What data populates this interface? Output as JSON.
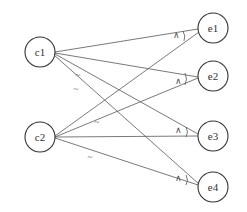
{
  "diagram": {
    "type": "bipartite-graph",
    "left_nodes": [
      {
        "id": "c1",
        "label": "c1",
        "cx": 40,
        "cy": 52
      },
      {
        "id": "c2",
        "label": "c2",
        "cx": 40,
        "cy": 137
      }
    ],
    "right_nodes": [
      {
        "id": "e1",
        "label": "e1",
        "cx": 213,
        "cy": 30
      },
      {
        "id": "e2",
        "label": "e2",
        "cx": 213,
        "cy": 76
      },
      {
        "id": "e3",
        "label": "e3",
        "cx": 213,
        "cy": 136
      },
      {
        "id": "e4",
        "label": "e4",
        "cx": 213,
        "cy": 187
      }
    ],
    "node_radius": 15,
    "edges": [
      {
        "from": "c1",
        "to": "e1"
      },
      {
        "from": "c1",
        "to": "e2"
      },
      {
        "from": "c1",
        "to": "e3",
        "mark": "~"
      },
      {
        "from": "c1",
        "to": "e4",
        "mark": "~"
      },
      {
        "from": "c2",
        "to": "e1"
      },
      {
        "from": "c2",
        "to": "e2",
        "mark": "~"
      },
      {
        "from": "c2",
        "to": "e3"
      },
      {
        "from": "c2",
        "to": "e4",
        "mark": "~"
      }
    ],
    "negation_marks": [
      {
        "label": "~",
        "x": 78,
        "y": 75
      },
      {
        "label": "~",
        "x": 76,
        "y": 89
      },
      {
        "label": "~",
        "x": 97,
        "y": 122
      },
      {
        "label": "~",
        "x": 90,
        "y": 157
      }
    ],
    "conjunction_marks": [
      {
        "label": "∧",
        "node": "e1",
        "x": 176,
        "y": 35
      },
      {
        "label": "∧",
        "node": "e2",
        "x": 178,
        "y": 81
      },
      {
        "label": "∧",
        "node": "e3",
        "x": 178,
        "y": 130
      },
      {
        "label": "∧",
        "node": "e4",
        "x": 178,
        "y": 178
      }
    ]
  }
}
